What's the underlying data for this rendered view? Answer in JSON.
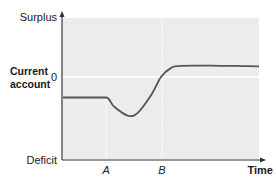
{
  "chart_data": {
    "type": "line",
    "title": "",
    "xlabel": "Time",
    "ylabel": [
      "Current",
      "account"
    ],
    "y_top_label": "Surplus",
    "y_bottom_label": "Deficit",
    "zero_label": "0",
    "x_markers": [
      {
        "label": "A",
        "x": 0.22
      },
      {
        "label": "B",
        "x": 0.505
      }
    ],
    "ylim": [
      -1,
      1
    ],
    "xlim": [
      0,
      1
    ],
    "zero_line": 0,
    "grid": false,
    "series": [
      {
        "name": "Current account (J-curve)",
        "color": "#555555",
        "points": [
          [
            0.0,
            -0.25
          ],
          [
            0.22,
            -0.25
          ],
          [
            0.26,
            -0.36
          ],
          [
            0.33,
            -0.47
          ],
          [
            0.38,
            -0.44
          ],
          [
            0.45,
            -0.22
          ],
          [
            0.5,
            0.0
          ],
          [
            0.55,
            0.15
          ],
          [
            0.6,
            0.19
          ],
          [
            0.8,
            0.19
          ],
          [
            1.0,
            0.18
          ]
        ]
      }
    ],
    "colors": {
      "plot_background": "#ececec",
      "axis": "#333333",
      "zero_line": "#ffffff",
      "marker_line": "#ffffff",
      "curve": "#555555"
    }
  }
}
